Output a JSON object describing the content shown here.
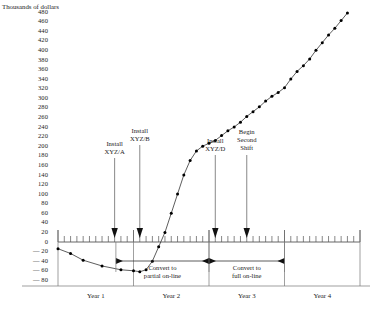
{
  "chart_data": {
    "type": "line",
    "title": "Thousands of dollars",
    "ylabel": "Thousands of dollars",
    "xlabel": "",
    "ylim": [
      -90,
      490
    ],
    "yticks": [
      480,
      460,
      440,
      420,
      400,
      380,
      360,
      340,
      320,
      300,
      280,
      260,
      240,
      220,
      200,
      180,
      160,
      140,
      120,
      100,
      80,
      60,
      40,
      20,
      0,
      -20,
      -40,
      -60,
      -80
    ],
    "ytick_labels": [
      "480",
      "460",
      "440",
      "420",
      "400",
      "380",
      "360",
      "340",
      "320",
      "300",
      "280",
      "260",
      "240",
      "220",
      "200",
      "180",
      "160",
      "140",
      "120",
      "100",
      "80",
      "60",
      "40",
      "20",
      "0",
      "— 20",
      "— 40",
      "— 60",
      "— 80"
    ],
    "xlim": [
      0,
      48
    ],
    "x_unit": "months",
    "x_major_ticks": [
      0,
      12,
      24,
      36,
      48
    ],
    "x_minor_tick_interval": 1,
    "grid": false,
    "legend": null,
    "x": [
      0,
      2,
      4,
      7,
      10,
      12,
      13,
      14,
      15,
      16,
      17,
      18,
      19,
      20,
      21,
      22,
      23,
      24,
      25,
      26,
      27,
      28,
      29,
      30,
      31,
      32,
      33,
      34,
      35,
      36,
      37,
      38,
      39,
      40,
      41,
      42,
      43,
      44,
      45,
      46
    ],
    "values": [
      -14,
      -24,
      -38,
      -50,
      -58,
      -60,
      -62,
      -58,
      -40,
      -10,
      20,
      60,
      100,
      140,
      170,
      190,
      200,
      206,
      212,
      222,
      232,
      240,
      250,
      262,
      272,
      282,
      294,
      304,
      312,
      322,
      340,
      356,
      368,
      382,
      400,
      416,
      432,
      446,
      462,
      478
    ],
    "series": [
      {
        "name": "Cumulative cash flow",
        "values": [
          -14,
          -24,
          -38,
          -50,
          -58,
          -60,
          -62,
          -58,
          -40,
          -10,
          20,
          60,
          100,
          140,
          170,
          190,
          200,
          206,
          212,
          222,
          232,
          240,
          250,
          262,
          272,
          282,
          294,
          304,
          312,
          322,
          340,
          356,
          368,
          382,
          400,
          416,
          432,
          446,
          462,
          478
        ]
      }
    ],
    "annotations": [
      {
        "id": "install-xyz-a",
        "label": "Install\nXYZ/A",
        "line1": "Install",
        "line2": "XYZ/A",
        "x_month": 9
      },
      {
        "id": "install-xyz-b",
        "label": "Install\nXYZ/B",
        "line1": "Install",
        "line2": "XYZ/B",
        "x_month": 13
      },
      {
        "id": "install-xyz-d",
        "label": "Install\nXYZ/D",
        "line1": "Install",
        "line2": "XYZ/D",
        "x_month": 25
      },
      {
        "id": "begin-second-shift",
        "label": "Begin\nSecond\nShift",
        "line1": "Begin",
        "line2": "Second",
        "line3": "Shift",
        "x_month": 30
      }
    ],
    "brackets": [
      {
        "id": "convert-partial",
        "line1": "Convert to",
        "line2": "partial on-line"
      },
      {
        "id": "convert-full",
        "line1": "Convert to",
        "line2": "full on-line"
      }
    ],
    "periods": [
      {
        "id": "year-1",
        "label": "Year 1"
      },
      {
        "id": "year-2",
        "label": "Year 2"
      },
      {
        "id": "year-3",
        "label": "Year 3"
      },
      {
        "id": "year-4",
        "label": "Year 4"
      }
    ],
    "colors": {
      "line": "#222222",
      "marker": "#000000",
      "axis": "#555555",
      "text": "#1a1a1a"
    }
  }
}
